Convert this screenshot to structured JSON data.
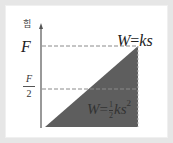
{
  "diagram": {
    "type": "force-displacement graph",
    "y_axis_label": "힘",
    "y_ticks": [
      {
        "label": "F",
        "position": "top"
      },
      {
        "label_numerator": "F",
        "label_denominator": "2",
        "position": "middle"
      }
    ],
    "line_label": {
      "lhs": "W",
      "eq": "=",
      "rhs": "ks"
    },
    "area_label": {
      "lhs": "W",
      "eq": "=",
      "frac_num": "1",
      "frac_den": "2",
      "rhs": "ks",
      "exponent": "2"
    },
    "colors": {
      "area_fill": "#5e5e5e",
      "axis": "#555555",
      "dashed_line": "#8a8a8a",
      "frame_border": "#e6e6e6",
      "background": "#ffffff"
    }
  }
}
